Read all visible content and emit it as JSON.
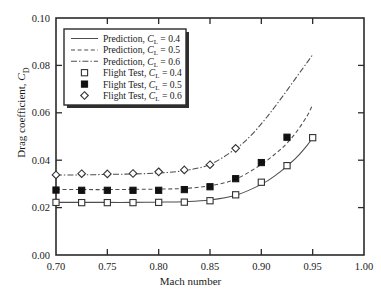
{
  "chart_data": {
    "type": "line",
    "title": "",
    "xlabel": "Mach number",
    "ylabel": "Drag coefficient, C_D",
    "xlim": [
      0.7,
      1.0
    ],
    "ylim": [
      0.0,
      0.1
    ],
    "xticks": [
      "0.70",
      "0.75",
      "0.80",
      "0.85",
      "0.90",
      "0.95",
      "1.00"
    ],
    "xtick_values": [
      0.7,
      0.75,
      0.8,
      0.85,
      0.9,
      0.95,
      1.0
    ],
    "yticks": [
      "0.00",
      "0.02",
      "0.04",
      "0.06",
      "0.08",
      "0.10"
    ],
    "ytick_values": [
      0.0,
      0.02,
      0.04,
      0.06,
      0.08,
      0.1
    ],
    "grid": false,
    "legend_position": "top-left",
    "legend_entries": [
      "Prediction, C_L = 0.4",
      "Prediction, C_L = 0.5",
      "Prediction, C_L = 0.6",
      "Flight Test, C_L = 0.4",
      "Flight Test, C_L = 0.5",
      "Flight Test, C_L = 0.6"
    ],
    "series": [
      {
        "name": "Prediction, C_L = 0.4",
        "kind": "line",
        "style": "solid",
        "color": "#4d4d4d",
        "x": [
          0.7,
          0.725,
          0.75,
          0.775,
          0.8,
          0.825,
          0.85,
          0.875,
          0.9,
          0.915,
          0.925,
          0.935,
          0.945,
          0.95
        ],
        "y": [
          0.0222,
          0.0222,
          0.0222,
          0.0222,
          0.0223,
          0.0225,
          0.0232,
          0.0252,
          0.0298,
          0.034,
          0.0375,
          0.0415,
          0.0465,
          0.0495
        ]
      },
      {
        "name": "Prediction, C_L = 0.5",
        "kind": "line",
        "style": "dashed",
        "color": "#4d4d4d",
        "x": [
          0.7,
          0.725,
          0.75,
          0.775,
          0.8,
          0.825,
          0.85,
          0.875,
          0.9,
          0.915,
          0.925,
          0.935,
          0.945,
          0.95
        ],
        "y": [
          0.0276,
          0.0276,
          0.0276,
          0.0277,
          0.0278,
          0.0281,
          0.0292,
          0.032,
          0.0382,
          0.0432,
          0.0472,
          0.0524,
          0.059,
          0.0635
        ]
      },
      {
        "name": "Prediction, C_L = 0.6",
        "kind": "line",
        "style": "dashdot",
        "color": "#4d4d4d",
        "x": [
          0.7,
          0.725,
          0.75,
          0.775,
          0.8,
          0.825,
          0.85,
          0.875,
          0.89,
          0.905,
          0.92,
          0.935,
          0.945,
          0.95
        ],
        "y": [
          0.0338,
          0.0338,
          0.034,
          0.0342,
          0.0346,
          0.0356,
          0.0382,
          0.0448,
          0.0505,
          0.058,
          0.0665,
          0.0755,
          0.0815,
          0.0845
        ]
      },
      {
        "name": "Flight Test, C_L = 0.4",
        "kind": "scatter",
        "marker": "open-square",
        "color": "#333333",
        "x": [
          0.7,
          0.725,
          0.75,
          0.775,
          0.8,
          0.825,
          0.85,
          0.875,
          0.9,
          0.925,
          0.95
        ],
        "y": [
          0.0222,
          0.0221,
          0.0221,
          0.0221,
          0.0222,
          0.0223,
          0.0229,
          0.0254,
          0.0307,
          0.0377,
          0.0495
        ]
      },
      {
        "name": "Flight Test, C_L = 0.5",
        "kind": "scatter",
        "marker": "filled-square",
        "color": "#111111",
        "x": [
          0.7,
          0.725,
          0.75,
          0.775,
          0.8,
          0.825,
          0.85,
          0.875,
          0.9,
          0.925
        ],
        "y": [
          0.0274,
          0.0273,
          0.0273,
          0.0273,
          0.0273,
          0.0276,
          0.0288,
          0.0322,
          0.039,
          0.0497
        ]
      },
      {
        "name": "Flight Test, C_L = 0.6",
        "kind": "scatter",
        "marker": "open-diamond",
        "color": "#333333",
        "x": [
          0.7,
          0.725,
          0.75,
          0.775,
          0.8,
          0.825,
          0.85,
          0.875
        ],
        "y": [
          0.0338,
          0.0343,
          0.0342,
          0.0344,
          0.0351,
          0.0359,
          0.0381,
          0.045
        ]
      }
    ]
  },
  "legend": {
    "rows": [
      {
        "sample": "solid-line",
        "text_pre": "Prediction, ",
        "sym": "C",
        "sub": "L",
        "text_post": " = 0.4"
      },
      {
        "sample": "dashed-line",
        "text_pre": "Prediction, ",
        "sym": "C",
        "sub": "L",
        "text_post": " = 0.5"
      },
      {
        "sample": "dashdot-line",
        "text_pre": "Prediction, ",
        "sym": "C",
        "sub": "L",
        "text_post": " = 0.6"
      },
      {
        "sample": "open-square",
        "text_pre": "Flight Test, ",
        "sym": "C",
        "sub": "L",
        "text_post": " = 0.4"
      },
      {
        "sample": "filled-square",
        "text_pre": "Flight Test, ",
        "sym": "C",
        "sub": "L",
        "text_post": " = 0.5"
      },
      {
        "sample": "open-diamond",
        "text_pre": "Flight Test, ",
        "sym": "C",
        "sub": "L",
        "text_post": " = 0.6"
      }
    ]
  },
  "axes": {
    "xlabel_text": "Mach number",
    "ylabel_pre": "Drag coefficient, ",
    "ylabel_sym": "C",
    "ylabel_sub": "D"
  }
}
